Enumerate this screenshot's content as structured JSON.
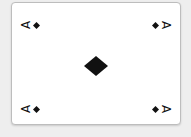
{
  "card": {
    "rank": "A",
    "suit": "diamonds",
    "suit_icon": "diamond-icon",
    "suit_color": "#111111",
    "orientation": "landscape"
  },
  "corners": {
    "top_left": "A",
    "top_right": "A",
    "bottom_left": "A",
    "bottom_right": "A"
  }
}
